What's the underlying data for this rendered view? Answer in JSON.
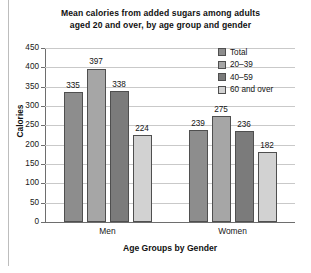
{
  "chart_data": {
    "type": "bar",
    "title": "Mean calories from added sugars among adults aged 20 and over, by age group and gender",
    "title_lines": [
      "Mean calories from added sugars among adults",
      "aged 20 and over, by age group and gender"
    ],
    "xlabel": "Age Groups by Gender",
    "ylabel": "Calories",
    "categories": [
      "Men",
      "Women"
    ],
    "series": [
      {
        "name": "Total",
        "values": [
          335,
          239
        ],
        "color": "#8d8d8d"
      },
      {
        "name": "20–39",
        "values": [
          397,
          275
        ],
        "color": "#a6a6a6"
      },
      {
        "name": "40–59",
        "values": [
          338,
          236
        ],
        "color": "#7b7b7b"
      },
      {
        "name": "60 and over",
        "values": [
          224,
          182
        ],
        "color": "#d2d2d2"
      }
    ],
    "ylim": [
      0,
      450
    ],
    "ytick_step": 50,
    "yticks": [
      0,
      50,
      100,
      150,
      200,
      250,
      300,
      350,
      400,
      450
    ],
    "ytick_labels": [
      "0",
      "50",
      "100",
      "150",
      "200",
      "250",
      "300",
      "350",
      "400",
      "450"
    ],
    "grid": true,
    "grid_axis": "y",
    "legend_position": "top-right-inside",
    "data_labels": true,
    "data_label_values": [
      [
        "335",
        "397",
        "338",
        "224"
      ],
      [
        "239",
        "275",
        "236",
        "182"
      ]
    ]
  },
  "legend": {
    "items": [
      {
        "label": "Total"
      },
      {
        "label": "20–39"
      },
      {
        "label": "40–59"
      },
      {
        "label": "60 and over"
      }
    ]
  }
}
